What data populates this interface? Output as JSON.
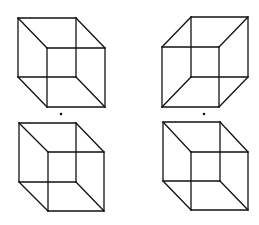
{
  "figure": {
    "background": "#ffffff",
    "line_color": "#111111"
  },
  "cubes": [
    {
      "id": "top-left",
      "back": [
        [
          18,
          18
        ],
        [
          76,
          18
        ],
        [
          76,
          77
        ],
        [
          18,
          77
        ]
      ],
      "front": [
        [
          47,
          48
        ],
        [
          105,
          48
        ],
        [
          105,
          107
        ],
        [
          47,
          107
        ]
      ]
    },
    {
      "id": "top-right",
      "back": [
        [
          191,
          17
        ],
        [
          248,
          17
        ],
        [
          248,
          77
        ],
        [
          191,
          77
        ]
      ],
      "front": [
        [
          162,
          47
        ],
        [
          219,
          47
        ],
        [
          219,
          107
        ],
        [
          162,
          107
        ]
      ]
    },
    {
      "id": "bottom-left",
      "back": [
        [
          19,
          123
        ],
        [
          76,
          123
        ],
        [
          76,
          182
        ],
        [
          19,
          182
        ]
      ],
      "front": [
        [
          48,
          152
        ],
        [
          104,
          152
        ],
        [
          104,
          211
        ],
        [
          48,
          211
        ]
      ]
    },
    {
      "id": "bottom-right",
      "back": [
        [
          163,
          122
        ],
        [
          220,
          122
        ],
        [
          220,
          181
        ],
        [
          163,
          181
        ]
      ],
      "front": [
        [
          191,
          152
        ],
        [
          248,
          152
        ],
        [
          248,
          210
        ],
        [
          191,
          210
        ]
      ]
    }
  ],
  "dots": [
    {
      "id": "fixation-dot-left",
      "x": 61,
      "y": 114
    },
    {
      "id": "fixation-dot-right",
      "x": 204,
      "y": 114
    }
  ]
}
